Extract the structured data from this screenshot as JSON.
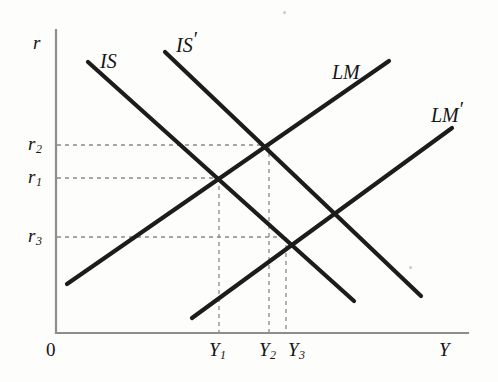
{
  "figure": {
    "background_color": "#fdfdfc",
    "curve_color": "#1c1c1c",
    "axis_color": "#8d8d8d",
    "guide_color": "#8a8a8a"
  },
  "axes": {
    "y_axis_label": "r",
    "x_axis_label": "Y",
    "origin_label": "0",
    "x_axis_y": 333,
    "y_axis_x": 56,
    "x_axis_end": 468,
    "y_axis_top": 30
  },
  "y_ticks": [
    {
      "label": "r",
      "sub": "2",
      "y": 145
    },
    {
      "label": "r",
      "sub": "1",
      "y": 178
    },
    {
      "label": "r",
      "sub": "3",
      "y": 237
    }
  ],
  "x_ticks": [
    {
      "label": "Y",
      "sub": "1",
      "x": 219
    },
    {
      "label": "Y",
      "sub": "2",
      "x": 269
    },
    {
      "label": "Y",
      "sub": "3",
      "x": 286
    }
  ],
  "curves": [
    {
      "name": "IS",
      "label": "IS",
      "prime": "",
      "slope": "downward",
      "x1": 88,
      "y1": 62,
      "x2": 354,
      "y2": 301,
      "label_x": 100,
      "label_y": 45
    },
    {
      "name": "IS-prime",
      "label": "IS",
      "prime": "′",
      "slope": "downward",
      "x1": 165,
      "y1": 52,
      "x2": 421,
      "y2": 296,
      "label_x": 176,
      "label_y": 30
    },
    {
      "name": "LM",
      "label": "LM",
      "prime": "",
      "slope": "upward",
      "x1": 67,
      "y1": 284,
      "x2": 389,
      "y2": 61,
      "label_x": 333,
      "label_y": 57
    },
    {
      "name": "LM-prime",
      "label": "LM",
      "prime": "′",
      "slope": "upward",
      "x1": 192,
      "y1": 318,
      "x2": 452,
      "y2": 128,
      "label_x": 432,
      "label_y": 99
    }
  ],
  "equilibria": [
    {
      "name": "E1",
      "x": 219,
      "y": 178,
      "rate": "r1",
      "output": "Y1",
      "curves": "IS × LM"
    },
    {
      "name": "E2",
      "x": 269,
      "y": 145,
      "rate": "r2",
      "output": "Y2",
      "curves": "IS′ × LM"
    },
    {
      "name": "E3",
      "x": 286,
      "y": 237,
      "rate": "r3",
      "output": "Y3",
      "curves": "IS × LM′"
    }
  ]
}
